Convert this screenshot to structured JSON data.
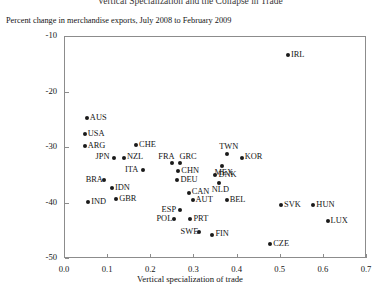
{
  "chart_data": {
    "type": "scatter",
    "title": "Vertical Specialization and the Collapse in Trade",
    "subtitle": "Percent change in merchandise exports, July 2008 to February 2009",
    "xlabel": "Vertical specialization of trade",
    "ylabel": "",
    "xlim": [
      0.0,
      0.7
    ],
    "ylim": [
      -50,
      -10
    ],
    "xticks": [
      "0.0",
      "0.1",
      "0.2",
      "0.3",
      "0.4",
      "0.5",
      "0.6",
      "0.7"
    ],
    "xtick_values": [
      0.0,
      0.1,
      0.2,
      0.3,
      0.4,
      0.5,
      0.6,
      0.7
    ],
    "yticks": [
      "-10",
      "-20",
      "-30",
      "-40",
      "-50"
    ],
    "ytick_values": [
      -10,
      -20,
      -30,
      -40,
      -50
    ],
    "grid": false,
    "legend": "none",
    "marker_color": "#1a1a1a",
    "frame_color": "#8c8c8c",
    "points": [
      {
        "label": "IRL",
        "x": 0.519,
        "y": -13.4,
        "label_pos": "right"
      },
      {
        "label": "AUS",
        "x": 0.053,
        "y": -24.8,
        "label_pos": "right"
      },
      {
        "label": "USA",
        "x": 0.048,
        "y": -27.7,
        "label_pos": "right"
      },
      {
        "label": "ARG",
        "x": 0.048,
        "y": -29.9,
        "label_pos": "right"
      },
      {
        "label": "CHE",
        "x": 0.167,
        "y": -29.6,
        "label_pos": "right"
      },
      {
        "label": "JPN",
        "x": 0.115,
        "y": -31.9,
        "label_pos": "left"
      },
      {
        "label": "NZL",
        "x": 0.139,
        "y": -31.9,
        "label_pos": "right"
      },
      {
        "label": "TWN",
        "x": 0.377,
        "y": -31.2,
        "label_pos": "above"
      },
      {
        "label": "KOR",
        "x": 0.412,
        "y": -31.9,
        "label_pos": "right"
      },
      {
        "label": "FRA",
        "x": 0.251,
        "y": -32.8,
        "label_pos": "above-left"
      },
      {
        "label": "GRC",
        "x": 0.27,
        "y": -32.8,
        "label_pos": "above-right"
      },
      {
        "label": "MEX",
        "x": 0.366,
        "y": -33.5,
        "label_pos": "below"
      },
      {
        "label": "CHN",
        "x": 0.265,
        "y": -34.4,
        "label_pos": "right"
      },
      {
        "label": "ITA",
        "x": 0.183,
        "y": -34.2,
        "label_pos": "left"
      },
      {
        "label": "DNK",
        "x": 0.351,
        "y": -35.1,
        "label_pos": "right"
      },
      {
        "label": "DEU",
        "x": 0.263,
        "y": -36.0,
        "label_pos": "right"
      },
      {
        "label": "NLD",
        "x": 0.36,
        "y": -36.5,
        "label_pos": "below"
      },
      {
        "label": "BRA",
        "x": 0.092,
        "y": -36.0,
        "label_pos": "left"
      },
      {
        "label": "IDN",
        "x": 0.111,
        "y": -37.4,
        "label_pos": "right"
      },
      {
        "label": "CAN",
        "x": 0.289,
        "y": -38.2,
        "label_pos": "right"
      },
      {
        "label": "AUT",
        "x": 0.298,
        "y": -39.5,
        "label_pos": "right"
      },
      {
        "label": "BEL",
        "x": 0.377,
        "y": -39.6,
        "label_pos": "right"
      },
      {
        "label": "IND",
        "x": 0.056,
        "y": -39.9,
        "label_pos": "right"
      },
      {
        "label": "GBR",
        "x": 0.121,
        "y": -39.4,
        "label_pos": "right"
      },
      {
        "label": "SVK",
        "x": 0.503,
        "y": -40.4,
        "label_pos": "right"
      },
      {
        "label": "HUN",
        "x": 0.578,
        "y": -40.4,
        "label_pos": "right"
      },
      {
        "label": "ESP",
        "x": 0.268,
        "y": -41.3,
        "label_pos": "left"
      },
      {
        "label": "POL",
        "x": 0.256,
        "y": -43.0,
        "label_pos": "left"
      },
      {
        "label": "PRT",
        "x": 0.293,
        "y": -43.0,
        "label_pos": "right"
      },
      {
        "label": "LUX",
        "x": 0.611,
        "y": -43.4,
        "label_pos": "right"
      },
      {
        "label": "SWE",
        "x": 0.312,
        "y": -45.4,
        "label_pos": "left"
      },
      {
        "label": "FIN",
        "x": 0.344,
        "y": -45.8,
        "label_pos": "right"
      },
      {
        "label": "CZE",
        "x": 0.478,
        "y": -47.5,
        "label_pos": "right"
      }
    ]
  }
}
